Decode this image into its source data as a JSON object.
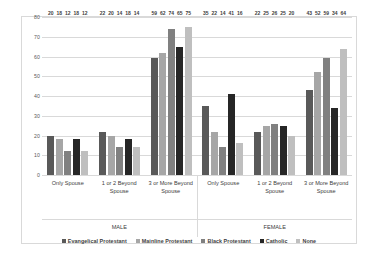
{
  "chart_data": {
    "type": "bar",
    "title": "",
    "xlabel": "",
    "ylabel": "",
    "ylim": [
      0,
      80
    ],
    "yticks": [
      0,
      10,
      20,
      30,
      40,
      50,
      60,
      70,
      80
    ],
    "grid": true,
    "legend_position": "bottom",
    "categories": [
      "Only Spouse",
      "1 or 2 Beyond Spouse",
      "3 or More Beyond Spouse",
      "Only Spouse",
      "1 or 2 Beyond Spouse",
      "3 or More Beyond Spouse"
    ],
    "groups": [
      {
        "name": "MALE",
        "categories": [
          "Only Spouse",
          "1 or 2 Beyond Spouse",
          "3 or More Beyond Spouse"
        ]
      },
      {
        "name": "FEMALE",
        "categories": [
          "Only Spouse",
          "1 or 2 Beyond Spouse",
          "3 or More Beyond Spouse"
        ]
      }
    ],
    "series": [
      {
        "name": "Evangelical Protestant",
        "color": "#595959",
        "values": [
          20,
          22,
          59,
          35,
          22,
          43
        ]
      },
      {
        "name": "Mainline Protestant",
        "color": "#a6a6a6",
        "values": [
          18,
          20,
          62,
          22,
          25,
          52
        ]
      },
      {
        "name": "Black Protestant",
        "color": "#808080",
        "values": [
          12,
          14,
          74,
          14,
          26,
          59
        ]
      },
      {
        "name": "Catholic",
        "color": "#262626",
        "values": [
          18,
          18,
          65,
          41,
          25,
          34
        ]
      },
      {
        "name": "None",
        "color": "#bfbfbf",
        "values": [
          12,
          14,
          75,
          16,
          20,
          64
        ]
      }
    ]
  },
  "axis": {
    "category_labels": [
      "Only Spouse",
      "1 or 2 Beyond Spouse",
      "3 or More Beyond Spouse",
      "Only Spouse",
      "1 or 2 Beyond Spouse",
      "3 or More Beyond Spouse"
    ],
    "gender_labels": [
      "MALE",
      "FEMALE"
    ]
  }
}
